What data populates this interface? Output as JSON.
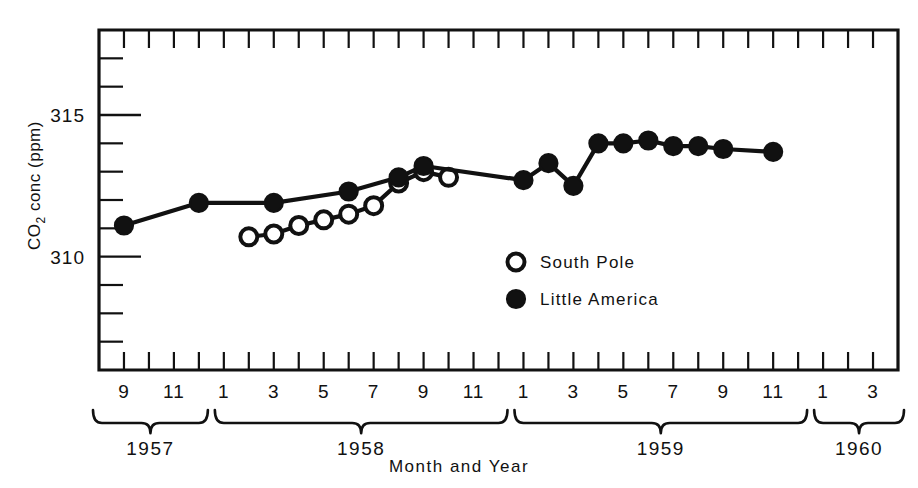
{
  "chart_data": {
    "type": "line",
    "title": "",
    "xlabel": "Month and Year",
    "ylabel": "CO2 conc (ppm)",
    "ylabel_parts": {
      "prefix": "CO",
      "sub": "2",
      "suffix": " conc  (ppm)"
    },
    "ylim": [
      306,
      318
    ],
    "ytick_labels": [
      "310",
      "315"
    ],
    "ytick_values": [
      310,
      315
    ],
    "yminor_step": 1,
    "xlim_months": [
      "1957-08",
      "1960-04"
    ],
    "grid": false,
    "legend_position": "center-right-inside",
    "xtick_labels": [
      "9",
      "11",
      "1",
      "3",
      "5",
      "7",
      "9",
      "11",
      "1",
      "3",
      "5",
      "7",
      "9",
      "11",
      "1",
      "3"
    ],
    "xtick_months": [
      "1957-09",
      "1957-11",
      "1958-01",
      "1958-03",
      "1958-05",
      "1958-07",
      "1958-09",
      "1958-11",
      "1959-01",
      "1959-03",
      "1959-05",
      "1959-07",
      "1959-09",
      "1959-11",
      "1960-01",
      "1960-03"
    ],
    "year_groups": [
      {
        "label": "1957",
        "start_month": "1957-08",
        "end_month": "1957-12"
      },
      {
        "label": "1958",
        "start_month": "1958-01",
        "end_month": "1958-12"
      },
      {
        "label": "1959",
        "start_month": "1959-01",
        "end_month": "1959-12"
      },
      {
        "label": "1960",
        "start_month": "1960-01",
        "end_month": "1960-04"
      }
    ],
    "series": [
      {
        "name": "South Pole",
        "marker": "open-circle",
        "points": [
          {
            "month": "1958-02",
            "value": 310.7
          },
          {
            "month": "1958-03",
            "value": 310.8
          },
          {
            "month": "1958-04",
            "value": 311.1
          },
          {
            "month": "1958-05",
            "value": 311.3
          },
          {
            "month": "1958-06",
            "value": 311.5
          },
          {
            "month": "1958-07",
            "value": 311.8
          },
          {
            "month": "1958-08",
            "value": 312.6
          },
          {
            "month": "1958-09",
            "value": 313.0
          },
          {
            "month": "1958-10",
            "value": 312.8
          }
        ]
      },
      {
        "name": "Little America",
        "marker": "filled-circle",
        "points": [
          {
            "month": "1957-09",
            "value": 311.1
          },
          {
            "month": "1957-12",
            "value": 311.9
          },
          {
            "month": "1958-03",
            "value": 311.9
          },
          {
            "month": "1958-06",
            "value": 312.3
          },
          {
            "month": "1958-08",
            "value": 312.8
          },
          {
            "month": "1958-09",
            "value": 313.2
          },
          {
            "month": "1959-01",
            "value": 312.7
          },
          {
            "month": "1959-02",
            "value": 313.3
          },
          {
            "month": "1959-03",
            "value": 312.5
          },
          {
            "month": "1959-04",
            "value": 314.0
          },
          {
            "month": "1959-05",
            "value": 314.0
          },
          {
            "month": "1959-06",
            "value": 314.1
          },
          {
            "month": "1959-07",
            "value": 313.9
          },
          {
            "month": "1959-08",
            "value": 313.9
          },
          {
            "month": "1959-09",
            "value": 313.8
          },
          {
            "month": "1959-11",
            "value": 313.7
          }
        ]
      }
    ],
    "legend": [
      {
        "label": "South Pole",
        "marker": "open-circle"
      },
      {
        "label": "Little America",
        "marker": "filled-circle"
      }
    ]
  },
  "colors": {
    "ink": "#111111",
    "paper": "#ffffff"
  }
}
